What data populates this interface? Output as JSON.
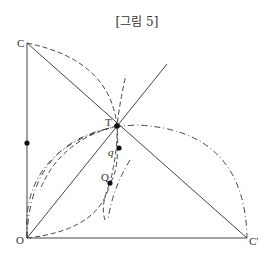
{
  "figure": {
    "title": "[그림 5]",
    "labels": {
      "C": "C",
      "O": "O",
      "C_prime": "C'",
      "T": "T",
      "q": "q",
      "Q": "Q"
    },
    "points": {
      "C": [
        27,
        43
      ],
      "O": [
        27,
        238
      ],
      "C_prime": [
        247,
        238
      ],
      "T": [
        117,
        126
      ],
      "q": [
        119,
        148
      ],
      "Q": [
        110,
        183
      ],
      "left_mark": [
        27,
        143
      ]
    },
    "line_color": "#444444"
  }
}
